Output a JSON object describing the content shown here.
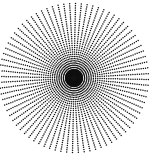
{
  "figure": {
    "type": "radial-dot-pattern",
    "background": "#ffffff",
    "dot_color": "#111111",
    "center": [
      74,
      78
    ],
    "outer_radius": 76,
    "inner_radius": 4,
    "ray_count": 80,
    "dot_spacing": 2.2,
    "dot_radius": 0.75,
    "core_radius": 13
  }
}
